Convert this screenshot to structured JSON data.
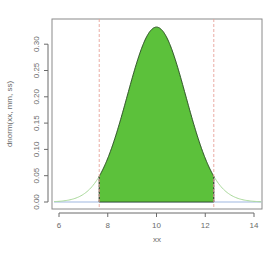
{
  "chart_data": {
    "type": "area",
    "title": "",
    "xlabel": "xx",
    "ylabel": "dnorm(xx, mm, ss)",
    "distribution": {
      "family": "normal",
      "mean": 10,
      "sd": 1.2
    },
    "xlim": [
      5.75,
      14.35
    ],
    "ylim": [
      -0.013,
      0.347
    ],
    "x_ticks": [
      6,
      8,
      10,
      12,
      14
    ],
    "x_tick_labels": [
      "6",
      "8",
      "10",
      "12",
      "14"
    ],
    "y_ticks": [
      0.0,
      0.05,
      0.1,
      0.15,
      0.2,
      0.25,
      0.3
    ],
    "y_tick_labels": [
      "0.00",
      "0.05",
      "0.10",
      "0.15",
      "0.20",
      "0.25",
      "0.30"
    ],
    "peak": {
      "x": 10,
      "y": 0.3325
    },
    "shaded_region": {
      "from": 7.65,
      "to": 12.35,
      "fill": "#5cc13b",
      "outline": "#2f4a2a"
    },
    "vertical_lines": [
      {
        "x": 7.65,
        "color": "#e8a39a",
        "style": "dashed"
      },
      {
        "x": 12.35,
        "color": "#e8a39a",
        "style": "dashed"
      }
    ],
    "baseline": {
      "y": 0,
      "color": "#9fb7e0"
    },
    "tail_curve_color": "#a9d99a",
    "grid": false,
    "legend": null
  },
  "colors": {
    "axis": "#6b6b6b",
    "box": "#8a8a8a",
    "fill": "#5cc13b",
    "fill_outline": "#2f4a2a",
    "tail": "#a9d99a",
    "baseline": "#9fb7e0",
    "ref_lines": "#e8a39a"
  }
}
